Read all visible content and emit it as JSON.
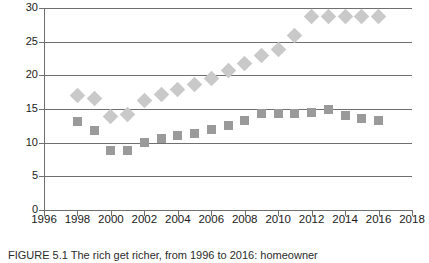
{
  "caption": "FIGURE 5.1   The rich get richer, from 1996 to 2016: homeowner",
  "colors": {
    "series_diamond": "#c9c9c9",
    "series_square": "#9a9a9a",
    "axis": "#6f6f6f",
    "text": "#1a1a1a",
    "background": "#ffffff"
  },
  "chart_data": {
    "type": "scatter",
    "title": "",
    "xlabel": "",
    "ylabel": "",
    "xlim": [
      1996,
      2018
    ],
    "ylim": [
      0,
      30
    ],
    "xticks": [
      1996,
      1998,
      2000,
      2002,
      2004,
      2006,
      2008,
      2010,
      2012,
      2014,
      2016,
      2018
    ],
    "yticks": [
      0,
      5,
      10,
      15,
      20,
      25,
      30
    ],
    "xtick_labels": [
      "1996",
      "1998",
      "2000",
      "2002",
      "2004",
      "2006",
      "2008",
      "2010",
      "2012",
      "2014",
      "2016",
      "2018"
    ],
    "ytick_labels": [
      "0",
      "5",
      "10",
      "15",
      "20",
      "25",
      "30"
    ],
    "grid": true,
    "grid_axis": "y",
    "legend": "none",
    "x": [
      1998,
      1999,
      2000,
      2001,
      2002,
      2003,
      2004,
      2005,
      2006,
      2007,
      2008,
      2009,
      2010,
      2011,
      2012,
      2013,
      2014,
      2015,
      2016
    ],
    "series": [
      {
        "name": "diamond-series",
        "marker": "diamond",
        "color": "#c9c9c9",
        "values": [
          17.0,
          16.5,
          13.9,
          14.2,
          16.3,
          17.2,
          17.9,
          18.7,
          19.5,
          20.7,
          21.8,
          22.9,
          23.8,
          25.9,
          28.8,
          28.7,
          28.7,
          28.7,
          28.7
        ]
      },
      {
        "name": "square-series",
        "marker": "square",
        "color": "#9a9a9a",
        "values": [
          13.1,
          11.8,
          8.8,
          8.8,
          10.0,
          10.6,
          11.1,
          11.4,
          12.0,
          12.6,
          13.3,
          14.3,
          14.4,
          14.3,
          14.5,
          14.9,
          14.0,
          13.6,
          13.3
        ]
      }
    ]
  }
}
